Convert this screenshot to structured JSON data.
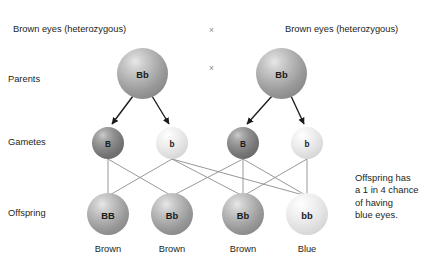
{
  "diagram": {
    "title_left": "Brown eyes (heterozygous)",
    "title_right": "Brown eyes (heterozygous)",
    "cross_symbol_top": "×",
    "cross_symbol_middle": "×",
    "row_labels": {
      "parents": "Parents",
      "gametes": "Gametes",
      "offspring": "Offspring"
    },
    "parents": [
      {
        "genotype": "Bb",
        "shade": "grey-mid"
      },
      {
        "genotype": "Bb",
        "shade": "grey-mid"
      }
    ],
    "gametes": [
      {
        "allele": "B",
        "shade": "grey-dark"
      },
      {
        "allele": "b",
        "shade": "grey-light"
      },
      {
        "allele": "B",
        "shade": "grey-dark"
      },
      {
        "allele": "b",
        "shade": "grey-light"
      }
    ],
    "offspring": [
      {
        "genotype": "BB",
        "shade": "grey-mid",
        "phenotype": "Brown"
      },
      {
        "genotype": "Bb",
        "shade": "grey-mid",
        "phenotype": "Brown"
      },
      {
        "genotype": "Bb",
        "shade": "grey-mid",
        "phenotype": "Brown"
      },
      {
        "genotype": "bb",
        "shade": "grey-light",
        "phenotype": "Blue"
      }
    ],
    "note_lines": [
      "Offspring has",
      "a 1 in 4 chance",
      "of having",
      "blue eyes."
    ],
    "colors": {
      "text": "#231f20",
      "line": "#8c8c8c",
      "arrow": "#1a1a1a",
      "background": "#ffffff"
    }
  }
}
